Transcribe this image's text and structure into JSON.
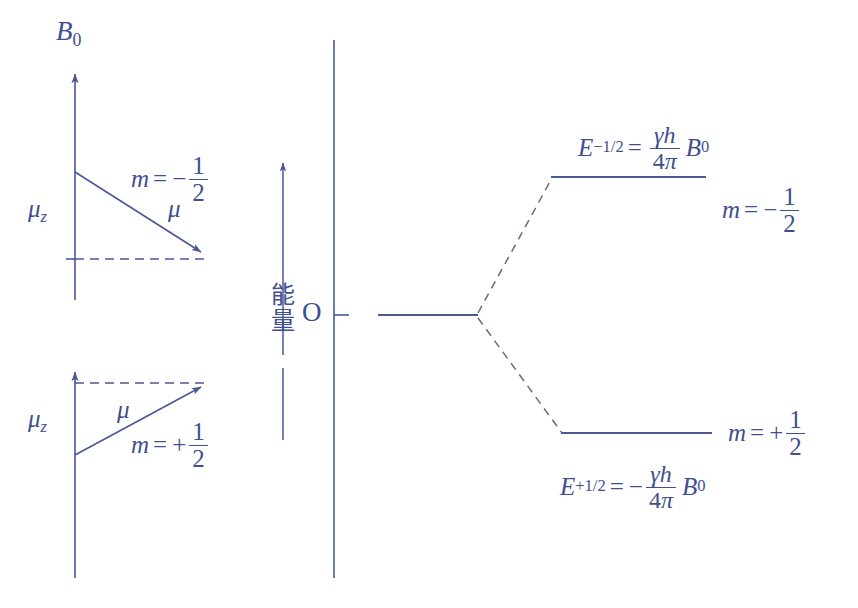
{
  "figure": {
    "type": "nmr-zeeman-splitting-diagram",
    "line_color": "#4a5894",
    "text_color": "#3f4f8f",
    "background": "#ffffff"
  },
  "left_panel": {
    "axis_label": "B",
    "axis_label_sub": "0",
    "upper_vector": {
      "mu_z_label": "μ",
      "mu_z_sub": "z",
      "mu_label": "μ",
      "m_var": "m",
      "m_equals": "=",
      "m_sign": "−",
      "m_num": "1",
      "m_den": "2"
    },
    "lower_vector": {
      "mu_z_label": "μ",
      "mu_z_sub": "z",
      "mu_label": "μ",
      "m_var": "m",
      "m_equals": "=",
      "m_sign": "+",
      "m_num": "1",
      "m_den": "2"
    }
  },
  "energy_axis": {
    "cjk_label_chars": [
      "能",
      "量"
    ],
    "cjk_label": "能量",
    "origin_label": "O"
  },
  "right_panel": {
    "upper_level": {
      "energy_var": "E",
      "energy_sub": "−1/2",
      "equals": "=",
      "sign": "",
      "frac_num_gamma": "γ",
      "frac_num_h": "h",
      "frac_den_4": "4",
      "frac_den_pi": "π",
      "field_var": "B",
      "field_sub": "0",
      "m_var": "m",
      "m_equals": "=",
      "m_sign": "−",
      "m_num": "1",
      "m_den": "2"
    },
    "lower_level": {
      "energy_var": "E",
      "energy_sub": "+1/2",
      "equals": "=",
      "sign": "−",
      "frac_num_gamma": "γ",
      "frac_num_h": "h",
      "frac_den_4": "4",
      "frac_den_pi": "π",
      "field_var": "B",
      "field_sub": "0",
      "m_var": "m",
      "m_equals": "=",
      "m_sign": "+",
      "m_num": "1",
      "m_den": "2"
    }
  }
}
